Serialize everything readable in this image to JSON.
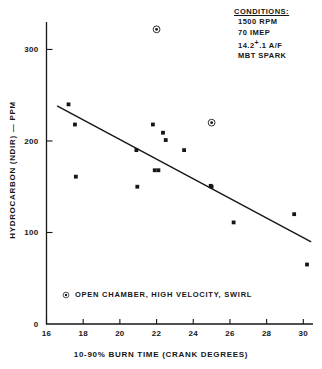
{
  "chart_data": {
    "type": "scatter",
    "title": "",
    "xlabel": "10-90% BURN TIME (CRANK DEGREES)",
    "ylabel": "HYDROCARBON (NDIR) — PPM",
    "xlim": [
      16,
      30.5
    ],
    "ylim": [
      0,
      330
    ],
    "xticks": [
      16,
      18,
      20,
      22,
      24,
      26,
      28,
      30
    ],
    "yticks": [
      0,
      100,
      200,
      300
    ],
    "grid": false,
    "legend_position": "inside-bottom-left",
    "series": [
      {
        "name": "standard",
        "marker": "filled-square",
        "color": "#161616",
        "points": [
          [
            17.2,
            240
          ],
          [
            17.55,
            218
          ],
          [
            17.6,
            161
          ],
          [
            20.9,
            190
          ],
          [
            20.95,
            150
          ],
          [
            21.8,
            218
          ],
          [
            21.9,
            168
          ],
          [
            22.1,
            168
          ],
          [
            22.35,
            209
          ],
          [
            22.5,
            201
          ],
          [
            23.5,
            190
          ],
          [
            24.95,
            151
          ],
          [
            25.0,
            150
          ],
          [
            26.2,
            111
          ],
          [
            29.5,
            120
          ],
          [
            30.2,
            65
          ]
        ]
      },
      {
        "name": "OPEN CHAMBER, HIGH VELOCITY, SWIRL",
        "marker": "circled-dot",
        "color": "#161616",
        "points": [
          [
            22.0,
            322
          ],
          [
            25.0,
            220
          ]
        ]
      }
    ],
    "trendline": {
      "type": "linear-fit",
      "color": "#161616",
      "x": [
        16.6,
        30.4
      ],
      "y": [
        238,
        90
      ]
    },
    "annotations": {
      "conditions_title": "CONDITIONS:",
      "conditions_lines": [
        "1500 RPM",
        "70 IMEP",
        "14.2 ⁺ .1 A/F",
        "MBT SPARK"
      ]
    }
  },
  "axis": {
    "x_tick_labels": [
      "16",
      "18",
      "20",
      "22",
      "24",
      "26",
      "28",
      "30"
    ],
    "y_tick_labels": [
      "0",
      "100",
      "200",
      "300"
    ],
    "x_title": "10-90% BURN TIME (CRANK DEGREES)",
    "y_title": "HYDROCARBON (NDIR) — PPM"
  },
  "conditions": {
    "title": "CONDITIONS:",
    "items": [
      {
        "value": "1500 RPM"
      },
      {
        "value": "70 IMEP"
      },
      {
        "prefix": "14.2",
        "sup": "+",
        "suffix": ".1 A/F"
      },
      {
        "value": "MBT SPARK"
      }
    ],
    "line1": "1500 RPM",
    "line2": "70 IMEP",
    "line3_prefix": "14.2",
    "line3_sup": "+",
    "line3_suffix": ".1 A/F",
    "line4": "MBT SPARK"
  },
  "legend": {
    "label": "OPEN CHAMBER, HIGH VELOCITY, SWIRL",
    "marker": "circled-dot-icon"
  }
}
